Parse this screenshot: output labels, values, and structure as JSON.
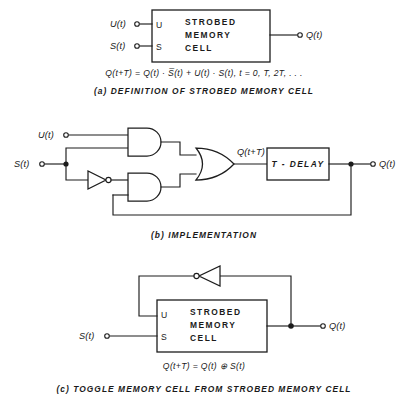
{
  "figure": {
    "background_color": "#ffffff",
    "line_color": "#1d1d1d"
  },
  "sections": {
    "a": {
      "caption": "(a) DEFINITION OF STROBED MEMORY CELL",
      "equation": "Q(t+T) = Q(t) · S̅(t) + U(t) · S(t),   t = 0, T, 2T, . . .",
      "block": {
        "label_line1": "STROBED",
        "label_line2": "MEMORY",
        "label_line3": "CELL",
        "pin_u": "U",
        "pin_s": "S"
      },
      "inputs": [
        {
          "name": "u-input",
          "label": "U(t)"
        },
        {
          "name": "s-input",
          "label": "S(t)"
        }
      ],
      "outputs": [
        {
          "name": "q-output",
          "label": "Q(t)"
        }
      ]
    },
    "b": {
      "caption": "(b) IMPLEMENTATION",
      "inputs": [
        {
          "name": "u-input",
          "label": "U(t)"
        },
        {
          "name": "s-input",
          "label": "S(t)"
        }
      ],
      "outputs": [
        {
          "name": "q-output",
          "label": "Q(t)"
        }
      ],
      "internal_labels": [
        {
          "name": "or-gate-output",
          "label": "Q(t+T)"
        }
      ],
      "delay_block": {
        "label": "T - DELAY"
      },
      "gates": [
        {
          "name": "and-gate-top",
          "type": "AND"
        },
        {
          "name": "and-gate-bottom",
          "type": "AND"
        },
        {
          "name": "or-gate",
          "type": "OR"
        },
        {
          "name": "inverter",
          "type": "NOT"
        }
      ]
    },
    "c": {
      "caption": "(c) TOGGLE MEMORY CELL FROM STROBED MEMORY CELL",
      "equation": "Q(t+T) = Q(t)  ⊕  S(t)",
      "block": {
        "label_line1": "STROBED",
        "label_line2": "MEMORY",
        "label_line3": "CELL",
        "pin_u": "U",
        "pin_s": "S"
      },
      "inputs": [
        {
          "name": "s-input",
          "label": "S(t)"
        }
      ],
      "outputs": [
        {
          "name": "q-output",
          "label": "Q(t)"
        }
      ],
      "gates": [
        {
          "name": "feedback-inverter",
          "type": "NOT"
        }
      ]
    }
  }
}
